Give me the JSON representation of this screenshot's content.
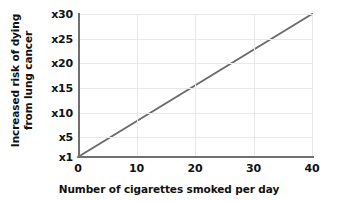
{
  "chart_data": {
    "type": "line",
    "title": "",
    "xlabel": "Number of cigarettes smoked per day",
    "ylabel_line1": "Increased risk of dying",
    "ylabel_line2": "from lung cancer",
    "x": [
      0,
      40
    ],
    "values": [
      1,
      30
    ],
    "series": [
      {
        "name": "Increased risk of dying from lung cancer",
        "x": [
          0,
          10,
          20,
          30,
          40
        ],
        "values": [
          1,
          8.25,
          15.5,
          22.75,
          30
        ],
        "color": "#6b6b6b"
      }
    ],
    "xlim": [
      0,
      40
    ],
    "ylim": [
      1,
      30
    ],
    "xticks": [
      0,
      10,
      20,
      30,
      40
    ],
    "xtick_labels": [
      "0",
      "10",
      "20",
      "30",
      "40"
    ],
    "yticks": [
      1,
      5,
      10,
      15,
      20,
      25,
      30
    ],
    "ytick_labels": [
      "x1",
      "x5",
      "x10",
      "x15",
      "x20",
      "x25",
      "x30"
    ],
    "grid": true,
    "grid_color": "#e8e8e8",
    "axis_color": "#707070",
    "legend": "none",
    "background": "#ffffff"
  }
}
